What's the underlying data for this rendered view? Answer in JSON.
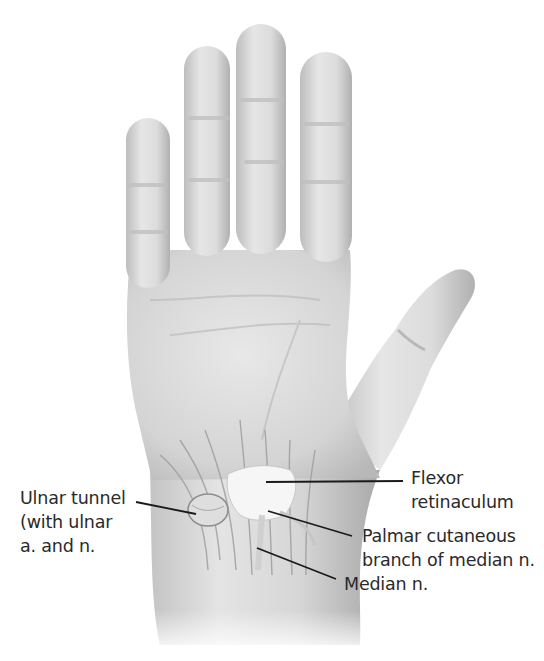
{
  "figure": {
    "colors": {
      "background": "#ffffff",
      "skin_light": "#ececec",
      "skin_mid": "#d2d2d2",
      "skin_dark": "#b4b4b4",
      "leader_line": "#1a1a1a",
      "text": "#2a2a2a"
    },
    "labels": [
      {
        "id": "ulnar-tunnel",
        "text": "Ulnar tunnel\n(with ulnar\na. and n.",
        "x": 20,
        "y": 486
      },
      {
        "id": "flexor-retinaculum",
        "text": "Flexor\nretinaculum",
        "x": 411,
        "y": 466
      },
      {
        "id": "palmar-cutaneous-branch",
        "text": "Palmar cutaneous\nbranch of median n.",
        "x": 362,
        "y": 524
      },
      {
        "id": "median-nerve",
        "text": "Median n.",
        "x": 344,
        "y": 572
      }
    ],
    "leader_lines": [
      {
        "id": "ulnar-tunnel-line",
        "x1": 136,
        "y1": 502,
        "x2": 196,
        "y2": 514
      },
      {
        "id": "flexor-retinaculum-line",
        "x1": 266,
        "y1": 482,
        "x2": 403,
        "y2": 481
      },
      {
        "id": "palmar-cutaneous-line",
        "x1": 268,
        "y1": 511,
        "x2": 352,
        "y2": 536
      },
      {
        "id": "median-nerve-line",
        "x1": 257,
        "y1": 548,
        "x2": 336,
        "y2": 579
      }
    ]
  }
}
